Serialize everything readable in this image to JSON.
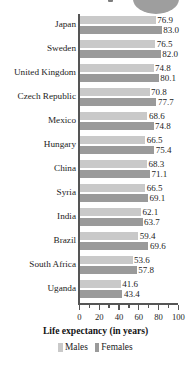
{
  "figure": {
    "decoration": {
      "top_blob": "rounded-gray-shape",
      "top_dot": "small-gray-square"
    }
  },
  "chart_data": {
    "type": "bar",
    "orientation": "horizontal",
    "title": "",
    "subtitle": "",
    "xlabel": "Life expectancy (in years)",
    "ylabel": "",
    "xlim": [
      0,
      100
    ],
    "xticks": [
      0,
      20,
      40,
      60,
      80,
      100
    ],
    "xtick_labels": [
      "0",
      "20",
      "40",
      "60",
      "80",
      "100"
    ],
    "minor_tick_interval": 10,
    "grid": false,
    "legend_position": "bottom",
    "categories": [
      "Japan",
      "Sweden",
      "United Kingdom",
      "Czech Republic",
      "Mexico",
      "Hungary",
      "China",
      "Syria",
      "India",
      "Brazil",
      "South Africa",
      "Uganda"
    ],
    "series": [
      {
        "name": "Males",
        "color": "#c9c9c9",
        "values": [
          76.9,
          76.5,
          74.8,
          70.8,
          68.6,
          66.5,
          68.3,
          66.5,
          62.1,
          59.4,
          53.6,
          41.6
        ],
        "labels": [
          "76.9",
          "76.5",
          "74.8",
          "70.8",
          "68.6",
          "66.5",
          "68.3",
          "66.5",
          "62.1",
          "59.4",
          "53.6",
          "41.6"
        ]
      },
      {
        "name": "Females",
        "color": "#9a9a9a",
        "values": [
          83.0,
          82.0,
          80.1,
          77.7,
          74.8,
          75.4,
          71.1,
          69.1,
          63.7,
          69.6,
          57.8,
          43.4
        ],
        "labels": [
          "83.0",
          "82.0",
          "80.1",
          "77.7",
          "74.8",
          "75.4",
          "71.1",
          "69.1",
          "63.7",
          "69.6",
          "57.8",
          "43.4"
        ]
      }
    ]
  }
}
